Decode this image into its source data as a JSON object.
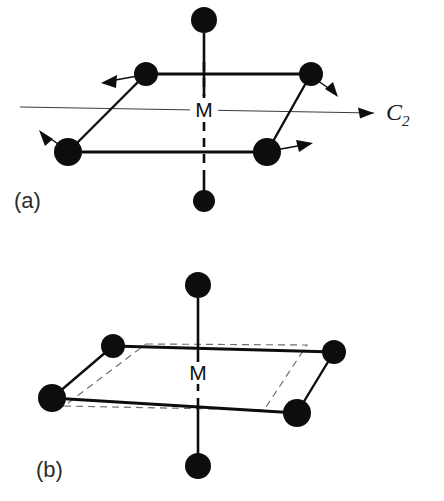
{
  "figure": {
    "background_color": "#ffffff",
    "ink_color": "#0d0d0d",
    "guide_color": "#6e6e6e",
    "width": 444,
    "height": 501
  },
  "panel_a": {
    "label": "(a)",
    "center_label": "M",
    "axis_label_main": "C",
    "axis_label_sub": "2",
    "atom_count": 6,
    "equatorial_atoms": 4,
    "axial_atoms": 2,
    "displacement_arrow_count": 4,
    "atoms": [
      {
        "name": "axial-top",
        "x": 204,
        "y": 20,
        "r": 13
      },
      {
        "name": "axial-bottom",
        "x": 204,
        "y": 201,
        "r": 11
      },
      {
        "name": "equatorial-back-left",
        "x": 146,
        "y": 74,
        "r": 12
      },
      {
        "name": "equatorial-back-right",
        "x": 311,
        "y": 74,
        "r": 12
      },
      {
        "name": "equatorial-front-left",
        "x": 68,
        "y": 152,
        "r": 14
      },
      {
        "name": "equatorial-front-right",
        "x": 267,
        "y": 152,
        "r": 14
      }
    ],
    "arrows": [
      {
        "name": "arrow-back-left",
        "from_x": 146,
        "from_y": 74,
        "to_x": 104,
        "to_y": 82
      },
      {
        "name": "arrow-back-right",
        "from_x": 311,
        "from_y": 74,
        "to_x": 334,
        "to_y": 93
      },
      {
        "name": "arrow-front-left",
        "from_x": 68,
        "from_y": 152,
        "to_x": 41,
        "to_y": 135
      },
      {
        "name": "arrow-front-right",
        "from_x": 267,
        "from_y": 152,
        "to_x": 309,
        "to_y": 145
      }
    ],
    "c2_axis": {
      "x_start": 20,
      "y_start": 107,
      "x_end": 374,
      "y_end": 113
    }
  },
  "panel_b": {
    "label": "(b)",
    "center_label": "M",
    "atom_count": 6,
    "equatorial_atoms": 4,
    "axial_atoms": 2,
    "has_reference_outline": true,
    "reference_outline_style": "dashed",
    "atoms": [
      {
        "name": "axial-top",
        "x": 198,
        "y": 35,
        "r": 13
      },
      {
        "name": "axial-bottom",
        "x": 198,
        "y": 216,
        "r": 13
      },
      {
        "name": "equatorial-back-left",
        "x": 113,
        "y": 96,
        "r": 12
      },
      {
        "name": "equatorial-back-right",
        "x": 334,
        "y": 102,
        "r": 12
      },
      {
        "name": "equatorial-front-left",
        "x": 52,
        "y": 148,
        "r": 14
      },
      {
        "name": "equatorial-front-right",
        "x": 297,
        "y": 163,
        "r": 14
      }
    ],
    "reference_square": [
      {
        "x": 146,
        "y": 94
      },
      {
        "x": 307,
        "y": 95
      },
      {
        "x": 264,
        "y": 160
      },
      {
        "x": 64,
        "y": 156
      }
    ]
  }
}
